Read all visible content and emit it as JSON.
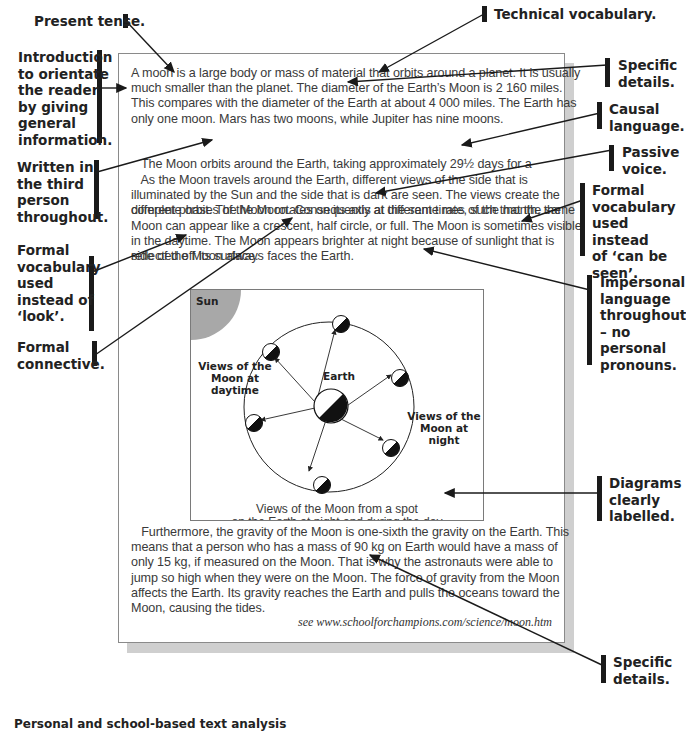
{
  "annotations_left": [
    {
      "id": "present-tense",
      "text": [
        "Present tense."
      ]
    },
    {
      "id": "introduction",
      "text": [
        "Introduction",
        "to orientate",
        "the reader",
        "by giving",
        "general",
        "information."
      ]
    },
    {
      "id": "third-person",
      "text": [
        "Written in",
        "the third",
        "person",
        "throughout."
      ]
    },
    {
      "id": "formal-vocab-look",
      "text": [
        "Formal",
        "vocabulary",
        "used",
        "instead of",
        "‘look’."
      ]
    },
    {
      "id": "formal-connective",
      "text": [
        "Formal",
        "connective."
      ]
    }
  ],
  "annotations_right": [
    {
      "id": "technical-vocabulary",
      "text": [
        "Technical vocabulary."
      ]
    },
    {
      "id": "specific-details-top",
      "text": [
        "Specific",
        "details."
      ]
    },
    {
      "id": "causal-language",
      "text": [
        "Causal",
        "language."
      ]
    },
    {
      "id": "passive-voice",
      "text": [
        "Passive",
        "voice."
      ]
    },
    {
      "id": "formal-vocab-seen",
      "text": [
        "Formal",
        "vocabulary",
        "used instead",
        "of ‘can be",
        "seen’."
      ]
    },
    {
      "id": "impersonal-language",
      "text": [
        "Impersonal",
        "language",
        "throughout",
        "– no",
        "personal",
        "pronouns."
      ]
    },
    {
      "id": "diagrams-labelled",
      "text": [
        "Diagrams",
        "clearly",
        "labelled."
      ]
    },
    {
      "id": "specific-details-bottom",
      "text": [
        "Specific",
        "details."
      ]
    }
  ],
  "document": {
    "paragraph1": [
      "A moon is a large body or mass of material that orbits around a planet. It is usually",
      "much smaller than the planet. The diameter of the Earth’s Moon is 2 160 miles.",
      "This compares with the diameter of the Earth at about 4 000 miles. The Earth has",
      "only one moon. Mars has two moons, while Jupiter has nine moons."
    ],
    "paragraph2": [
      "   The Moon orbits around the Earth, taking approximately 29½ days for a",
      "complete orbit. The Moon rotates on its axis at the same rate, such that the same",
      "side of the Moon always faces the Earth."
    ],
    "paragraph3": [
      "   As the Moon travels around the Earth, different views of the side that is",
      "illuminated by the Sun and the side that is dark are seen. The views create the",
      "different phases of the Moon. Consequently at different times of the month, the",
      "Moon can appear like a crescent, half circle, or full. The Moon is sometimes visible",
      "in the daytime. The Moon appears brighter at night because of sunlight that is",
      "reflected off its surface."
    ],
    "paragraph4": [
      "   Furthermore, the gravity of the Moon is one-sixth the gravity on the Earth. This",
      "means that a person who has a mass of 90 kg on Earth would have a mass of",
      "only 15 kg, if measured on the Moon. That is why the astronauts were able to",
      "jump so high when they were on the Moon. The force of gravity from the Moon",
      "affects the Earth. Its gravity reaches the Earth and pulls the oceans toward the",
      "Moon, causing the tides."
    ],
    "source": "see www.schoolforchampions.com/science/moon.htm"
  },
  "diagram": {
    "sun_label": "Sun",
    "earth_label": "Earth",
    "daytime_label": [
      "Views of the",
      "Moon at",
      "daytime"
    ],
    "night_label": [
      "Views of the",
      "Moon at night"
    ],
    "caption": [
      "Views of the Moon from a spot",
      "on the Earth at night and during the day"
    ]
  },
  "footer_partial": "Personal and school-based text analysis",
  "colors": {
    "ink": "#1a1a1a",
    "body_text": "#3a3a3a",
    "sun": "#a8a8a8",
    "shadow": "#cfcfcf"
  }
}
